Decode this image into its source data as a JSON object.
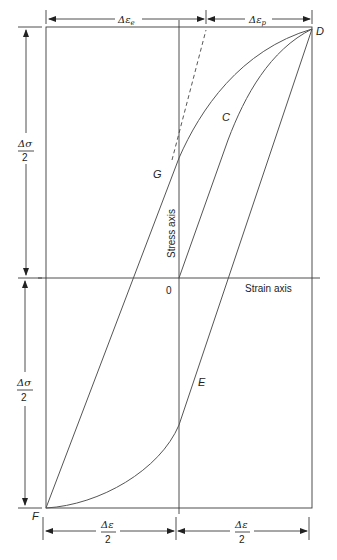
{
  "diagram": {
    "type": "stress-strain hysteresis loop",
    "axes": {
      "stress_axis_label": "Stress axis",
      "strain_axis_label": "Strain axis",
      "origin_label": "0"
    },
    "points": {
      "C": "C",
      "D": "D",
      "E": "E",
      "F": "F",
      "G": "G"
    },
    "dimensions": {
      "top_left": "Δε_e",
      "top_left_main": "Δε",
      "top_left_sub": "e",
      "top_right": "Δε_p",
      "top_right_main": "Δε",
      "top_right_sub": "p",
      "left_upper_num": "Δσ",
      "left_upper_den": "2",
      "left_lower_num": "Δσ",
      "left_lower_den": "2",
      "bottom_left_num": "Δε",
      "bottom_left_den": "2",
      "bottom_right_num": "Δε",
      "bottom_right_den": "2"
    }
  }
}
